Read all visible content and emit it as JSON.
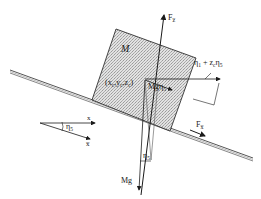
{
  "diagram": {
    "type": "free-body diagram",
    "colors": {
      "line": "#1a1a1a",
      "block_fill": "#d4d4d4",
      "surface_line": "#555555",
      "background": "#ffffff"
    },
    "labels": {
      "mass": "M",
      "center": "(xₐ,yₐ,zₐ)",
      "center_parts": {
        "open": "(x",
        "sub1": "c",
        "mid1": ",y",
        "sub2": "c",
        "mid2": ",z",
        "sub3": "c",
        "close": ")"
      },
      "force_z": "F",
      "force_z_sub": "z̅",
      "force_x": "F",
      "force_x_sub": "x̅",
      "gravity": "Mg",
      "gravity_component": "Mgη",
      "gravity_component_sub": "5",
      "displacement": "η̅",
      "displacement_parts": {
        "eta1": "η",
        "sub1": "1",
        "plus": " + z",
        "subc": "c",
        "eta5": "η",
        "sub5": "5"
      },
      "angle_block": "η",
      "angle_block_sub": "5",
      "angle_axes": "η",
      "angle_axes_sub": "5",
      "axis_x": "x",
      "axis_xbar": "x̅"
    }
  }
}
